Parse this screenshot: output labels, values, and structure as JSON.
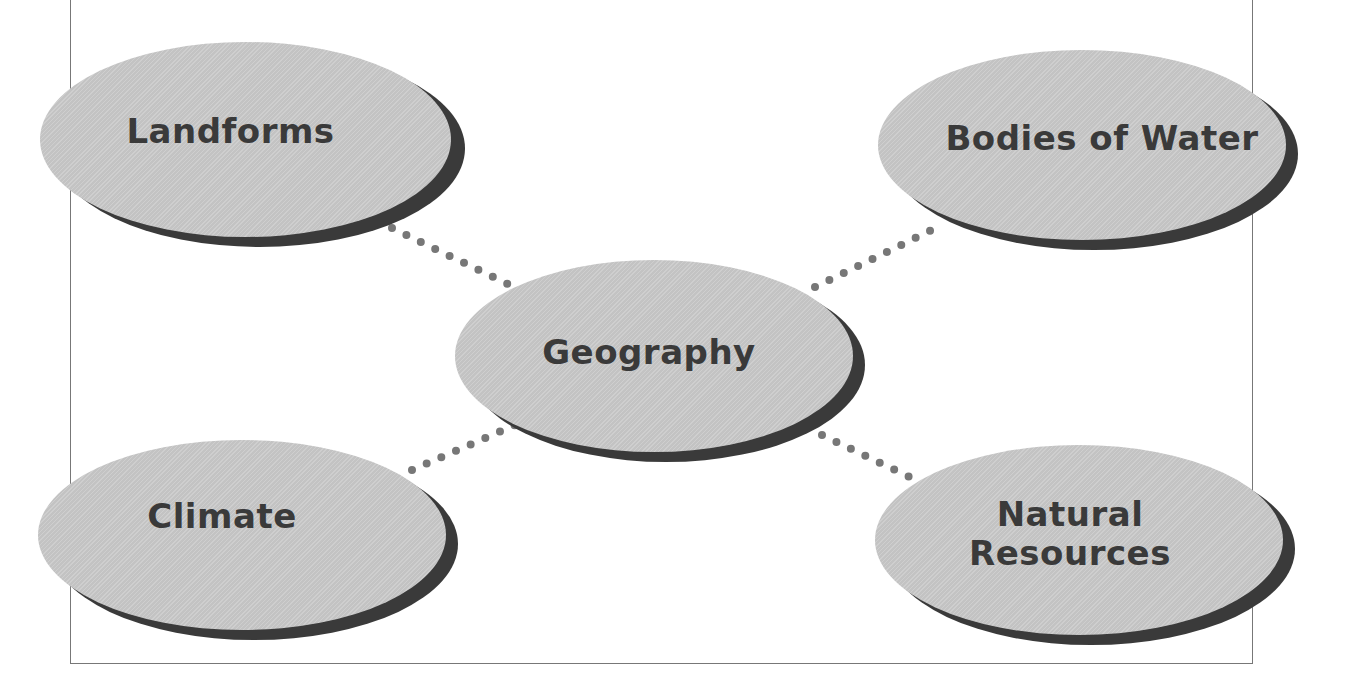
{
  "diagram": {
    "type": "concept-web",
    "center": {
      "id": "geography",
      "label": "Geography"
    },
    "nodes": [
      {
        "id": "landforms",
        "label": "Landforms"
      },
      {
        "id": "bodies-of-water",
        "label": "Bodies of Water"
      },
      {
        "id": "climate",
        "label": "Climate"
      },
      {
        "id": "natural-resources",
        "label_line1": "Natural",
        "label_line2": "Resources"
      }
    ],
    "connections": [
      {
        "from": "geography",
        "to": "landforms",
        "style": "dotted"
      },
      {
        "from": "geography",
        "to": "bodies-of-water",
        "style": "dotted"
      },
      {
        "from": "geography",
        "to": "climate",
        "style": "dotted"
      },
      {
        "from": "geography",
        "to": "natural-resources",
        "style": "dotted"
      }
    ],
    "colors": {
      "ellipse_fill": "#c9c9c9",
      "ellipse_shadow": "#3a3a3a",
      "text": "#3a3a3a",
      "connector": "#777777",
      "frame": "#777777"
    }
  }
}
